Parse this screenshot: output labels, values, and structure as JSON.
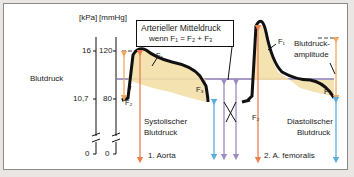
{
  "diagram": {
    "y_axis_label": "Blutdruck",
    "unit_kpa": "[kPa]",
    "unit_mmhg": "[mmHg]",
    "ticks_kpa": [
      "16",
      "10,7",
      "0"
    ],
    "ticks_mmhg": [
      "120",
      "80",
      "0"
    ],
    "annotation_box": {
      "line1": "Arterieller Mitteldruck",
      "line2": "wenn F₁ = F₂ + F₃"
    },
    "area_labels": {
      "f1": "F₁",
      "f2": "F₂",
      "f3": "F₃"
    },
    "labels": {
      "systolic_1": "Systolischer",
      "systolic_2": "Blutdruck",
      "diastolic_1": "Diastolischer",
      "diastolic_2": "Blutdruck",
      "amplitude_1": "Blutdruck-",
      "amplitude_2": "amplitude"
    },
    "panels": [
      {
        "label": "1. Aorta"
      },
      {
        "label": "2. A. femoralis"
      }
    ],
    "colors": {
      "curve": "#111111",
      "fill": "#f3dfa8",
      "mean_line": "#8a78b0",
      "systolic_arrow": "#e8804f",
      "diastolic_arrow": "#5aaee0",
      "amplitude_arrow": "#f0a860",
      "mean_arrow": "#9e8cc0"
    }
  }
}
